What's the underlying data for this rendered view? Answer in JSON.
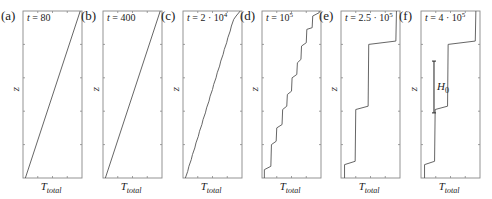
{
  "chart_data": {
    "type": "line",
    "title": "",
    "xlabel": "T_total",
    "ylabel": "z",
    "xlim": [
      0,
      1
    ],
    "ylim": [
      0,
      1
    ],
    "grid": false,
    "panels": [
      {
        "id": "a",
        "label": "(a)",
        "time_text": "t = 80",
        "time_prefix": "t = ",
        "time_value": "80",
        "time_exp": "",
        "xlabel_main": "T",
        "xlabel_sub": "total",
        "ylabel": "z",
        "profile": [
          [
            0.04,
            0.0
          ],
          [
            0.97,
            1.0
          ]
        ]
      },
      {
        "id": "b",
        "label": "(b)",
        "time_text": "t = 400",
        "time_prefix": "t = ",
        "time_value": "400",
        "time_exp": "",
        "xlabel_main": "T",
        "xlabel_sub": "total",
        "ylabel": "z",
        "profile": [
          [
            0.04,
            0.0
          ],
          [
            0.97,
            1.0
          ]
        ]
      },
      {
        "id": "c",
        "label": "(c)",
        "time_text": "t = 2 · 10^4",
        "time_prefix": "t = ",
        "time_value": "2 · 10",
        "time_exp": "4",
        "xlabel_main": "T",
        "xlabel_sub": "total",
        "ylabel": "z",
        "profile": [
          [
            0.04,
            0.0
          ],
          [
            0.08,
            0.04
          ],
          [
            0.1,
            0.07
          ],
          [
            0.14,
            0.11
          ],
          [
            0.16,
            0.14
          ],
          [
            0.2,
            0.18
          ],
          [
            0.22,
            0.21
          ],
          [
            0.26,
            0.25
          ],
          [
            0.28,
            0.28
          ],
          [
            0.32,
            0.32
          ],
          [
            0.34,
            0.35
          ],
          [
            0.38,
            0.39
          ],
          [
            0.4,
            0.42
          ],
          [
            0.44,
            0.46
          ],
          [
            0.46,
            0.49
          ],
          [
            0.5,
            0.53
          ],
          [
            0.52,
            0.56
          ],
          [
            0.56,
            0.6
          ],
          [
            0.58,
            0.63
          ],
          [
            0.62,
            0.67
          ],
          [
            0.64,
            0.7
          ],
          [
            0.68,
            0.74
          ],
          [
            0.7,
            0.77
          ],
          [
            0.74,
            0.81
          ],
          [
            0.76,
            0.84
          ],
          [
            0.8,
            0.88
          ],
          [
            0.82,
            0.91
          ],
          [
            0.86,
            0.95
          ],
          [
            0.9,
            0.97
          ],
          [
            0.97,
            1.0
          ]
        ]
      },
      {
        "id": "d",
        "label": "(d)",
        "time_text": "t = 10^5",
        "time_prefix": "t = ",
        "time_value": "10",
        "time_exp": "5",
        "xlabel_main": "T",
        "xlabel_sub": "total",
        "ylabel": "z",
        "profile": [
          [
            0.04,
            0.0
          ],
          [
            0.04,
            0.05
          ],
          [
            0.15,
            0.07
          ],
          [
            0.16,
            0.2
          ],
          [
            0.24,
            0.22
          ],
          [
            0.25,
            0.3
          ],
          [
            0.34,
            0.32
          ],
          [
            0.35,
            0.41
          ],
          [
            0.42,
            0.43
          ],
          [
            0.43,
            0.5
          ],
          [
            0.5,
            0.52
          ],
          [
            0.51,
            0.6
          ],
          [
            0.59,
            0.62
          ],
          [
            0.6,
            0.69
          ],
          [
            0.66,
            0.71
          ],
          [
            0.67,
            0.79
          ],
          [
            0.75,
            0.81
          ],
          [
            0.76,
            0.89
          ],
          [
            0.85,
            0.9
          ],
          [
            0.86,
            0.97
          ],
          [
            0.97,
            0.99
          ],
          [
            0.97,
            1.0
          ]
        ]
      },
      {
        "id": "e",
        "label": "(e)",
        "time_text": "t = 2.5 · 10^5",
        "time_prefix": "t = ",
        "time_value": "2.5 · 10",
        "time_exp": "5",
        "xlabel_main": "T",
        "xlabel_sub": "total",
        "ylabel": "z",
        "profile": [
          [
            0.06,
            0.0
          ],
          [
            0.06,
            0.08
          ],
          [
            0.24,
            0.1
          ],
          [
            0.25,
            0.41
          ],
          [
            0.46,
            0.43
          ],
          [
            0.47,
            0.8
          ],
          [
            0.93,
            0.82
          ],
          [
            0.94,
            1.0
          ]
        ]
      },
      {
        "id": "f",
        "label": "(f)",
        "time_text": "t = 4 · 10^5",
        "time_prefix": "t = ",
        "time_value": "4 · 10",
        "time_exp": "5",
        "xlabel_main": "T",
        "xlabel_sub": "total",
        "ylabel": "z",
        "profile": [
          [
            0.06,
            0.0
          ],
          [
            0.06,
            0.08
          ],
          [
            0.23,
            0.1
          ],
          [
            0.24,
            0.41
          ],
          [
            0.45,
            0.43
          ],
          [
            0.46,
            0.8
          ],
          [
            0.92,
            0.82
          ],
          [
            0.93,
            1.0
          ]
        ],
        "annotation": {
          "label": "H",
          "sub": "0",
          "z_from": 0.39,
          "z_to": 0.7,
          "t_pos": 0.22
        }
      }
    ],
    "ticks_per_axis": 5
  }
}
